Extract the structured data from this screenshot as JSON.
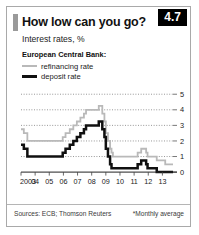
{
  "card": {
    "title": "How low can you go?",
    "subtitle": "Interest rates, %",
    "badge": "4.7"
  },
  "legend": {
    "group_title": "European Central Bank:",
    "items": [
      {
        "label": "refinancing rate",
        "color": "#b9b9b9"
      },
      {
        "label": "deposit rate",
        "color": "#101010"
      }
    ]
  },
  "footer": {
    "source": "Sources: ECB; Thomson Reuters",
    "footnote": "*Monthly average"
  },
  "chart_data": {
    "type": "line",
    "title": "How low can you go?",
    "subtitle": "Interest rates, %",
    "xlabel": "",
    "ylabel": "",
    "xlim": [
      2003.0,
      2013.75
    ],
    "ylim": [
      -0.25,
      5.4
    ],
    "yticks": [
      0,
      1,
      2,
      3,
      4,
      5
    ],
    "ytick_labels": [
      "0",
      "1",
      "2",
      "3",
      "4",
      "5"
    ],
    "y_axis_position": "right",
    "grid": "horizontal-dotted",
    "legend_position": "top-left",
    "xticks": [
      2003,
      2004,
      2005,
      2006,
      2007,
      2008,
      2009,
      2010,
      2011,
      2012,
      2013
    ],
    "xtick_labels": [
      "2003",
      "04",
      "05",
      "06",
      "07",
      "08",
      "09",
      "10",
      "11",
      "12",
      "13"
    ],
    "step": "post",
    "series": [
      {
        "name": "refinancing rate",
        "color": "#b9b9b9",
        "points": [
          [
            2003.0,
            2.75
          ],
          [
            2003.2,
            2.5
          ],
          [
            2003.45,
            2.0
          ],
          [
            2005.95,
            2.25
          ],
          [
            2006.15,
            2.5
          ],
          [
            2006.45,
            2.75
          ],
          [
            2006.7,
            3.0
          ],
          [
            2006.95,
            3.25
          ],
          [
            2007.2,
            3.5
          ],
          [
            2007.45,
            3.75
          ],
          [
            2007.6,
            4.0
          ],
          [
            2008.5,
            4.25
          ],
          [
            2008.75,
            3.75
          ],
          [
            2008.9,
            3.25
          ],
          [
            2009.0,
            2.5
          ],
          [
            2009.15,
            2.0
          ],
          [
            2009.3,
            1.5
          ],
          [
            2009.4,
            1.25
          ],
          [
            2009.5,
            1.0
          ],
          [
            2011.25,
            1.25
          ],
          [
            2011.5,
            1.5
          ],
          [
            2011.85,
            1.25
          ],
          [
            2011.95,
            1.0
          ],
          [
            2012.6,
            0.75
          ],
          [
            2013.2,
            0.5
          ],
          [
            2013.75,
            0.5
          ]
        ]
      },
      {
        "name": "deposit rate",
        "color": "#101010",
        "points": [
          [
            2003.0,
            1.75
          ],
          [
            2003.2,
            1.5
          ],
          [
            2003.45,
            1.0
          ],
          [
            2005.95,
            1.25
          ],
          [
            2006.15,
            1.5
          ],
          [
            2006.45,
            1.75
          ],
          [
            2006.7,
            2.0
          ],
          [
            2006.95,
            2.25
          ],
          [
            2007.2,
            2.5
          ],
          [
            2007.45,
            2.75
          ],
          [
            2007.6,
            3.0
          ],
          [
            2008.5,
            3.25
          ],
          [
            2008.75,
            2.75
          ],
          [
            2008.9,
            2.25
          ],
          [
            2009.0,
            1.5
          ],
          [
            2009.15,
            1.0
          ],
          [
            2009.3,
            0.5
          ],
          [
            2009.4,
            0.25
          ],
          [
            2009.5,
            0.25
          ],
          [
            2011.25,
            0.5
          ],
          [
            2011.5,
            0.75
          ],
          [
            2011.85,
            0.5
          ],
          [
            2011.95,
            0.25
          ],
          [
            2012.6,
            0.0
          ],
          [
            2013.75,
            0.0
          ]
        ]
      }
    ]
  }
}
